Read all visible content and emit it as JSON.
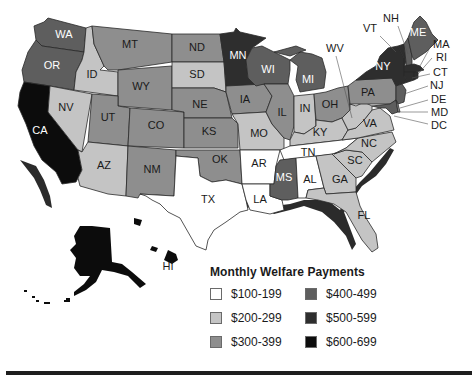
{
  "title": "Monthly Welfare Payments",
  "legend": {
    "title": "Monthly Welfare Payments",
    "items": [
      {
        "label": "$100-199",
        "color": "#ffffff"
      },
      {
        "label": "$200-299",
        "color": "#c4c4c4"
      },
      {
        "label": "$300-399",
        "color": "#8e8e8e"
      },
      {
        "label": "$400-499",
        "color": "#5e5e5e"
      },
      {
        "label": "$500-599",
        "color": "#2e2e2e"
      },
      {
        "label": "$600-699",
        "color": "#0c0c0c"
      }
    ]
  },
  "states": {
    "WA": {
      "label": "WA",
      "range": "$400-499"
    },
    "OR": {
      "label": "OR",
      "range": "$400-499"
    },
    "CA": {
      "label": "CA",
      "range": "$600-699"
    },
    "ID": {
      "label": "ID",
      "range": "$200-299"
    },
    "NV": {
      "label": "NV",
      "range": "$200-299"
    },
    "MT": {
      "label": "MT",
      "range": "$300-399"
    },
    "WY": {
      "label": "WY",
      "range": "$300-399"
    },
    "UT": {
      "label": "UT",
      "range": "$300-399"
    },
    "CO": {
      "label": "CO",
      "range": "$300-399"
    },
    "AZ": {
      "label": "AZ",
      "range": "$200-299"
    },
    "NM": {
      "label": "NM",
      "range": "$300-399"
    },
    "ND": {
      "label": "ND",
      "range": "$300-399"
    },
    "SD": {
      "label": "SD",
      "range": "$200-299"
    },
    "NE": {
      "label": "NE",
      "range": "$300-399"
    },
    "KS": {
      "label": "KS",
      "range": "$300-399"
    },
    "OK": {
      "label": "OK",
      "range": "$300-399"
    },
    "TX": {
      "label": "TX",
      "range": "$100-199"
    },
    "MN": {
      "label": "MN",
      "range": "$500-599"
    },
    "IA": {
      "label": "IA",
      "range": "$300-399"
    },
    "MO": {
      "label": "MO",
      "range": "$200-299"
    },
    "AR": {
      "label": "AR",
      "range": "$100-199"
    },
    "LA": {
      "label": "LA",
      "range": "$100-199"
    },
    "WI": {
      "label": "WI",
      "range": "$400-499"
    },
    "IL": {
      "label": "IL",
      "range": "$300-399"
    },
    "MI": {
      "label": "MI",
      "range": "$400-499"
    },
    "IN": {
      "label": "IN",
      "range": "$200-299"
    },
    "OH": {
      "label": "OH",
      "range": "$300-399"
    },
    "KY": {
      "label": "KY",
      "range": "$200-299"
    },
    "TN": {
      "label": "TN",
      "range": "$100-199"
    },
    "MS": {
      "label": "MS",
      "range": "$400-499"
    },
    "AL": {
      "label": "AL",
      "range": "$100-199"
    },
    "GA": {
      "label": "GA",
      "range": "$200-299"
    },
    "FL": {
      "label": "FL",
      "range": "$200-299"
    },
    "SC": {
      "label": "SC",
      "range": "$200-299"
    },
    "NC": {
      "label": "NC",
      "range": "$200-299"
    },
    "VA": {
      "label": "VA",
      "range": "$200-299"
    },
    "WV": {
      "label": "WV",
      "range": "$200-299"
    },
    "PA": {
      "label": "PA",
      "range": "$300-399"
    },
    "NY": {
      "label": "NY",
      "range": "$500-599"
    },
    "ME": {
      "label": "ME",
      "range": "$400-499"
    },
    "VT": {
      "label": "VT",
      "range": "$500-599"
    },
    "NH": {
      "label": "NH",
      "range": "$400-499"
    },
    "MA": {
      "label": "MA",
      "range": "$500-599"
    },
    "RI": {
      "label": "RI",
      "range": "$500-599"
    },
    "CT": {
      "label": "CT",
      "range": "$500-599"
    },
    "NJ": {
      "label": "NJ",
      "range": "$400-499"
    },
    "DE": {
      "label": "DE",
      "range": "$300-399"
    },
    "MD": {
      "label": "MD",
      "range": "$400-499"
    },
    "DC": {
      "label": "DC",
      "range": "$400-499"
    },
    "AK": {
      "label": "AK",
      "range": "$600-699"
    },
    "HI": {
      "label": "HI",
      "range": "$600-699"
    }
  }
}
